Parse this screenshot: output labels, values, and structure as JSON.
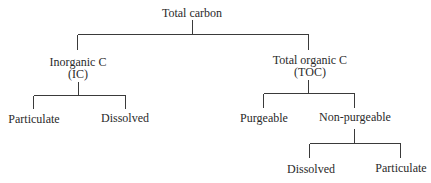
{
  "diagram": {
    "type": "tree",
    "root": {
      "label": "Total carbon"
    },
    "level1": {
      "inorganic": {
        "line1": "Inorganic C",
        "line2": "(IC)"
      },
      "organic": {
        "line1": "Total organic C",
        "line2": "(TOC)"
      }
    },
    "inorganic_children": {
      "particulate": "Particulate",
      "dissolved": "Dissolved"
    },
    "organic_children": {
      "purgeable": "Purgeable",
      "non_purgeable": "Non-purgeable"
    },
    "non_purgeable_children": {
      "dissolved": "Dissolved",
      "particulate": "Particulate"
    },
    "colors": {
      "line": "#3a3a3a",
      "text": "#2a2a2a",
      "background": "#ffffff"
    }
  }
}
